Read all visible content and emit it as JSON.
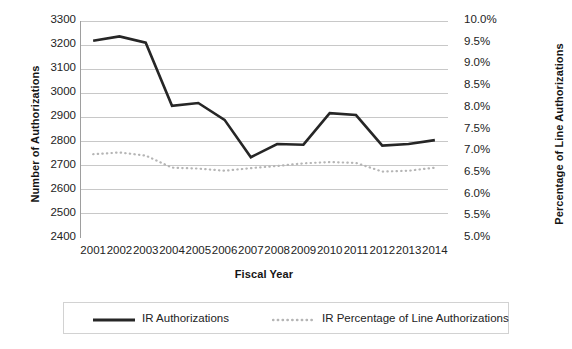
{
  "chart_data": {
    "type": "line",
    "title": "",
    "xlabel": "Fiscal Year",
    "ylabel": "Number of Authorizations",
    "y2label": "Percentage of Line Authorizations",
    "categories": [
      "2001",
      "2002",
      "2003",
      "2004",
      "2005",
      "2006",
      "2007",
      "2008",
      "2009",
      "2010",
      "2011",
      "2012",
      "2013",
      "2014"
    ],
    "ylim": [
      2400,
      3300
    ],
    "y2lim": [
      5.0,
      10.0
    ],
    "yticks": [
      "2400",
      "2500",
      "2600",
      "2700",
      "2800",
      "2900",
      "3000",
      "3100",
      "3200",
      "3300"
    ],
    "y2ticks": [
      "5.0%",
      "5.5%",
      "6.0%",
      "6.5%",
      "7.0%",
      "7.5%",
      "8.0%",
      "8.5%",
      "9.0%",
      "9.5%",
      "10.0%"
    ],
    "grid": true,
    "legend_position": "bottom",
    "series": [
      {
        "name": "IR Authorizations",
        "axis": "left",
        "style": "solid",
        "color": "#262626",
        "values": [
          3218,
          3236,
          3210,
          2948,
          2960,
          2890,
          2735,
          2790,
          2787,
          2918,
          2910,
          2783,
          2790,
          2806
        ]
      },
      {
        "name": "IR Percentage of Line Authorizations",
        "axis": "right",
        "style": "dotted",
        "color": "#b5b5b5",
        "values": [
          6.93,
          6.97,
          6.9,
          6.62,
          6.6,
          6.55,
          6.61,
          6.66,
          6.72,
          6.75,
          6.73,
          6.53,
          6.55,
          6.62
        ]
      }
    ]
  },
  "legend": {
    "items": [
      {
        "label": "IR Authorizations"
      },
      {
        "label": "IR Percentage of Line Authorizations"
      }
    ]
  }
}
